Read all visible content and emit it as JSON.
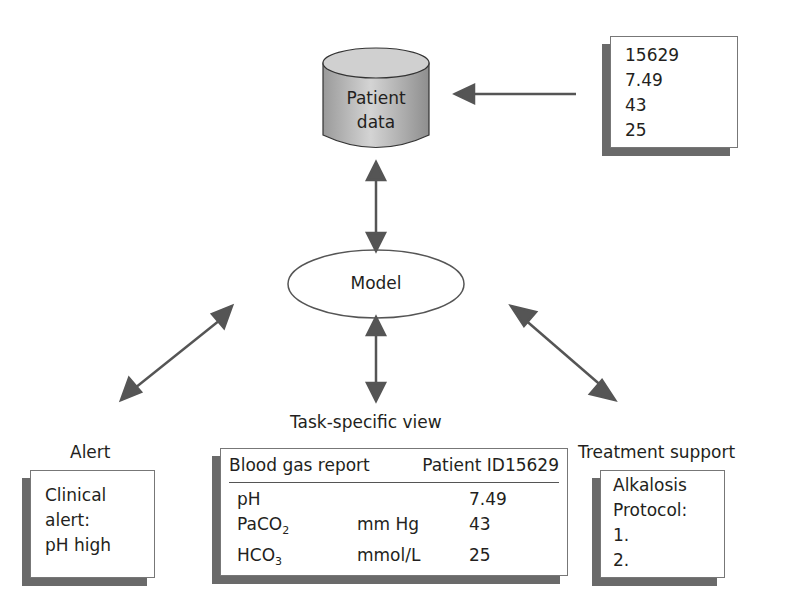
{
  "database": {
    "label_line1": "Patient",
    "label_line2": "data"
  },
  "input_record": {
    "values": [
      "15629",
      "7.49",
      "43",
      "25"
    ]
  },
  "model": {
    "label": "Model"
  },
  "alert": {
    "title": "Alert",
    "lines": [
      "Clinical",
      "alert:",
      "pH high"
    ]
  },
  "task_view": {
    "title": "Task-specific view",
    "report_title": "Blood gas report",
    "patient_id": "Patient ID15629",
    "rows": [
      {
        "name": "pH",
        "sub": "",
        "unit": "",
        "value": "7.49"
      },
      {
        "name": "PaCO",
        "sub": "2",
        "unit": "mm Hg",
        "value": "43"
      },
      {
        "name": "HCO",
        "sub": "3",
        "unit": "mmol/L",
        "value": "25"
      }
    ]
  },
  "treatment": {
    "title": "Treatment support",
    "lines": [
      "Alkalosis",
      "Protocol:",
      "1.",
      "2."
    ]
  },
  "colors": {
    "arrow": "#555555",
    "shadow": "#6a6a6a",
    "border": "#777777"
  }
}
